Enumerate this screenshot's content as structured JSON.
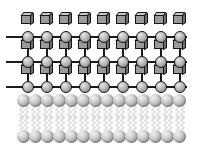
{
  "figure": {
    "background_color": "#ffffff",
    "width": 197,
    "height": 152
  },
  "colors": {
    "outline": "#161616",
    "bond_line": "#1b1b1b",
    "cube_front": "#9a9a9a",
    "cube_top": "#c9c9c9",
    "cube_side": "#6f6f6f",
    "lattice_node": "#b0b0b0",
    "lipid_head": "#bdbdbd",
    "lipid_tail": "#d8d8d8",
    "background": "#ffffff"
  },
  "lattice": {
    "label": "crystalline lattice",
    "columns": 9,
    "node_rows": 3,
    "cube_rows": 3,
    "column_x": [
      22,
      41,
      60,
      79,
      98,
      117,
      136,
      155,
      174
    ],
    "node_row_y": [
      31,
      56,
      81
    ],
    "cube_row_y": [
      12,
      37,
      62
    ],
    "bond_row_y": [
      31,
      56,
      81
    ],
    "node_diameter": 12,
    "cube_size": 11,
    "node_name": "lattice-node-sphere",
    "cube_name": "lattice-cube",
    "bond_name": "lattice-bond-line"
  },
  "bilayer": {
    "label": "lipid bilayer",
    "head_count": 14,
    "head_x": [
      17,
      29,
      41,
      53,
      65,
      77,
      89,
      101,
      113,
      125,
      137,
      149,
      161,
      173
    ],
    "upper_head_y": 4,
    "lower_head_y": 40,
    "head_diameter": 13,
    "tail_columns": 28,
    "upper_tail_y": 15,
    "lower_tail_y": 26,
    "tail_height": 14,
    "head_name": "lipid-head-group",
    "tail_name": "lipid-tail-chain"
  }
}
